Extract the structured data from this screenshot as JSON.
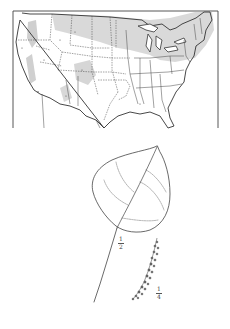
{
  "figure": {
    "type": "botanical-plate",
    "map": {
      "subject": "range map of the contiguous United States",
      "range_shading": "#cfcfcf",
      "line_color": "#333333"
    },
    "illustration": {
      "leaf_scale": {
        "numerator": "1",
        "denominator": "2"
      },
      "catkin_scale": {
        "numerator": "1",
        "denominator": "4"
      }
    }
  }
}
